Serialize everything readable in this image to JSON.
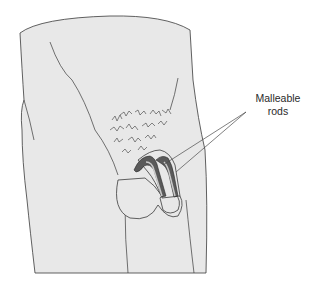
{
  "figure": {
    "colors": {
      "background": "#ffffff",
      "skin_fill": "#e8e8e8",
      "outline": "#3a3a3a",
      "rod_dark": "#5a5a5a",
      "rod_light": "#c9c9c9",
      "leader_line": "#4a4a4a"
    },
    "labels": [
      {
        "id": "malleable-rods",
        "line1": "Malleable",
        "line2": "rods",
        "leader_count": 2
      }
    ]
  }
}
